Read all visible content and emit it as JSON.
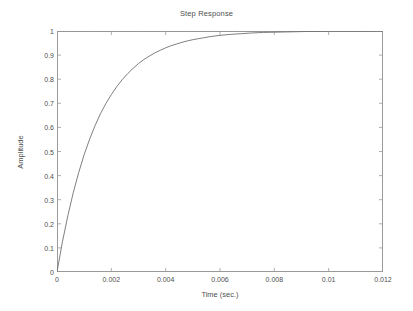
{
  "figure": {
    "background_color": "#ffffff",
    "axes_color": "#9a9a9a",
    "text_color": "#4f4f4f",
    "curve_color": "#707070",
    "reference_line_color": "#8a8a8a"
  },
  "chart_data": {
    "type": "line",
    "title": "Step Response",
    "xlabel": "Time (sec.)",
    "ylabel": "Amplitude",
    "xlim": [
      0,
      0.012
    ],
    "ylim": [
      0,
      1
    ],
    "grid": false,
    "legend": "none",
    "xticks": [
      0,
      0.002,
      0.004,
      0.006,
      0.008,
      0.01,
      0.012
    ],
    "xtick_labels": [
      "0",
      "0.002",
      "0.004",
      "0.006",
      "0.008",
      "0.01",
      "0.012"
    ],
    "yticks": [
      0,
      0.1,
      0.2,
      0.3,
      0.4,
      0.5,
      0.6,
      0.7,
      0.8,
      0.9,
      1
    ],
    "ytick_labels": [
      "0",
      "0.1",
      "0.2",
      "0.3",
      "0.4",
      "0.5",
      "0.6",
      "0.7",
      "0.8",
      "0.9",
      "1"
    ],
    "annotations": [
      {
        "name": "steady-state-reference",
        "style": "dotted",
        "orientation": "horizontal",
        "value": 1.0
      }
    ],
    "series": [
      {
        "name": "Step Response",
        "model": "first-order exponential rise",
        "time_constant_sec": 0.0015,
        "final_value": 1.0,
        "x": [
          0,
          0.0002,
          0.0004,
          0.0006,
          0.0008,
          0.001,
          0.0012,
          0.0014,
          0.0016,
          0.0018,
          0.002,
          0.0022,
          0.0024,
          0.0026,
          0.0028,
          0.003,
          0.0032,
          0.0034,
          0.0036,
          0.0038,
          0.004,
          0.0042,
          0.0044,
          0.0046,
          0.0048,
          0.005,
          0.0052,
          0.0054,
          0.0056,
          0.0058,
          0.006,
          0.0064,
          0.0068,
          0.0072,
          0.0076,
          0.008,
          0.0084,
          0.0088,
          0.0092,
          0.0096,
          0.01,
          0.0104,
          0.0108,
          0.0112,
          0.0116,
          0.012
        ],
        "y": [
          0,
          0.125,
          0.234,
          0.33,
          0.413,
          0.487,
          0.551,
          0.607,
          0.657,
          0.699,
          0.736,
          0.769,
          0.798,
          0.823,
          0.845,
          0.865,
          0.882,
          0.896,
          0.909,
          0.92,
          0.93,
          0.939,
          0.946,
          0.953,
          0.959,
          0.964,
          0.968,
          0.972,
          0.976,
          0.979,
          0.982,
          0.986,
          0.989,
          0.992,
          0.994,
          0.995,
          0.996,
          0.997,
          0.998,
          0.998,
          0.999,
          0.999,
          0.999,
          0.999,
          0.999,
          1.0
        ]
      }
    ]
  }
}
